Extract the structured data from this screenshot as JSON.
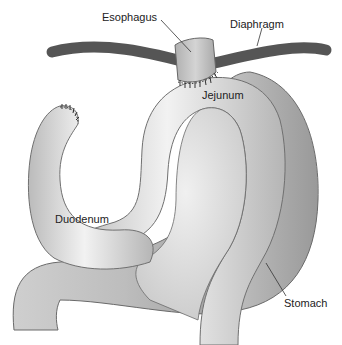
{
  "figure": {
    "type": "anatomical-illustration",
    "labels": {
      "esophagus": "Esophagus",
      "diaphragm": "Diaphragm",
      "jejunum": "Jejunum",
      "duodenum": "Duodenum",
      "stomach": "Stomach"
    },
    "colors": {
      "background": "#ffffff",
      "diaphragm": "#555555",
      "organ_fill_light": "#e4e4e4",
      "organ_fill_mid": "#c6c6c6",
      "organ_fill_dark": "#a8a8a8",
      "outline": "#6a6a6a",
      "suture": "#333333",
      "label_text": "#222222"
    }
  }
}
